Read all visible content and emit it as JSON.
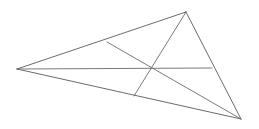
{
  "figure": {
    "kind": "geometry-diagram",
    "canvas": {
      "width": 259,
      "height": 129,
      "background": "#ffffff"
    },
    "style": {
      "edge_color": "#5a5a5a",
      "cevian_color": "#6b6b6b",
      "edge_width": 0.9,
      "cevian_width": 0.9
    },
    "vertices": [
      {
        "name": "left-vertex",
        "label": "A",
        "x": 17,
        "y": 69
      },
      {
        "name": "apex-vertex",
        "label": "B",
        "x": 186,
        "y": 12
      },
      {
        "name": "bottom-right-vertex",
        "label": "C",
        "x": 241,
        "y": 119
      }
    ],
    "interior_point": {
      "name": "concurrency-point",
      "label": "P",
      "x": 152,
      "y": 69
    },
    "edge_points": [
      {
        "name": "point-on-edge-AB",
        "label": "F",
        "x": 107,
        "y": 42
      },
      {
        "name": "point-on-edge-AC",
        "label": "D",
        "x": 134,
        "y": 96
      },
      {
        "name": "point-on-edge-BC",
        "label": "E",
        "x": 212,
        "y": 68
      }
    ],
    "edges": [
      {
        "name": "edge-A-B",
        "from": "A",
        "to": "B",
        "path": "M 17 69 L 186 12"
      },
      {
        "name": "edge-B-C",
        "from": "B",
        "to": "C",
        "path": "M 186 12 L 241 119"
      },
      {
        "name": "edge-C-A",
        "from": "C",
        "to": "A",
        "path": "M 241 119 L 17 69"
      }
    ],
    "cevians": [
      {
        "name": "cevian-A-to-E",
        "from": "A",
        "through": "P",
        "to": "E",
        "path": "M 17 69 L 212 68"
      },
      {
        "name": "cevian-B-to-D",
        "from": "B",
        "through": "P",
        "to": "D",
        "path": "M 186 12 L 134 96"
      },
      {
        "name": "cevian-F-to-C",
        "from": "F",
        "through": "P",
        "to": "C",
        "path": "M 107 42 L 241 119"
      }
    ]
  }
}
